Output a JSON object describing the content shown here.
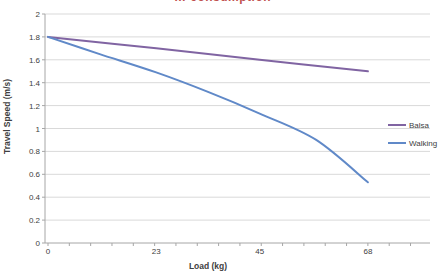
{
  "chart_data": {
    "type": "line",
    "title": {
      "visible_text": "… consumption",
      "note": "chart title is cropped by the top edge of the screenshot; only the bottom sliver of the dark-red letters is visible",
      "color": "#C0504D"
    },
    "xlabel": "Load (kg)",
    "ylabel": "Travel Speed (m/s)",
    "xlim": [
      0,
      81.2
    ],
    "ylim": [
      0,
      2
    ],
    "x_tick_values": [
      0,
      23,
      45,
      68
    ],
    "x_tick_labels": [
      "0",
      "23",
      "45",
      "68"
    ],
    "x_minor_tick_step": 4.533,
    "y_tick_values": [
      0,
      0.2,
      0.4,
      0.6,
      0.8,
      1,
      1.2,
      1.4,
      1.6,
      1.8,
      2
    ],
    "y_tick_labels": [
      "0",
      "0.2",
      "0.4",
      "0.6",
      "0.8",
      "1",
      "1.2",
      "1.4",
      "1.6",
      "1.8",
      "2"
    ],
    "grid": "horizontal",
    "legend_position": "right",
    "series": [
      {
        "name": "Balsa",
        "color": "#8064A2",
        "x": [
          0,
          23,
          45,
          68
        ],
        "values": [
          1.8,
          1.7,
          1.6,
          1.5
        ]
      },
      {
        "name": "Walking",
        "color": "#6089C8",
        "x": [
          0,
          11,
          23,
          34,
          45,
          57,
          68
        ],
        "values": [
          1.8,
          1.65,
          1.49,
          1.32,
          1.13,
          0.9,
          0.53
        ]
      }
    ],
    "colors": {
      "gridline": "#D9D9D9",
      "axis": "#A6A6A6",
      "tick_label": "#404040",
      "axis_title": "#404040",
      "legend_text": "#404040",
      "background": "#FFFFFF"
    }
  }
}
